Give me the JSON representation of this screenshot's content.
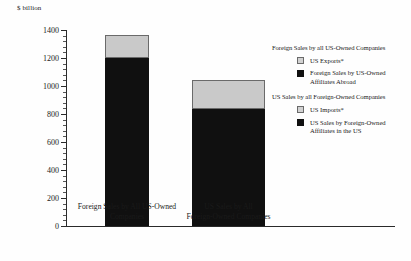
{
  "chart_data": {
    "type": "bar",
    "subtype": "stacked",
    "title": "",
    "xlabel": "",
    "ylabel": "$ billion",
    "ylim": [
      0,
      1400
    ],
    "ytick_step": 200,
    "yticks": [
      "0",
      "200",
      "400",
      "600",
      "800",
      "1000",
      "1200",
      "1400"
    ],
    "grid": false,
    "legend_position": "right",
    "categories": [
      "Foreign Sales by All US-Owned\nCompanies",
      "US Sales by All\nForeign-Owned Companies"
    ],
    "series": [
      {
        "name": "Sales by Affiliates",
        "color": "#101010",
        "values": [
          1200,
          835
        ]
      },
      {
        "name": "Trade (Exports / Imports)",
        "color": "#c9c9c9",
        "values": [
          165,
          210
        ]
      }
    ],
    "totals": [
      1365,
      1045
    ]
  },
  "axis": {
    "y_title": "$ billion"
  },
  "legend": {
    "groups": [
      {
        "heading": "Foreign Sales by all US-Owned Companies",
        "items": [
          {
            "label": "US Exports*",
            "swatch": "light"
          },
          {
            "label": "Foreign Sales by US-Owned\nAffiliates Abroad",
            "swatch": "dark"
          }
        ]
      },
      {
        "heading": "US Sales by all Foreign-Owned Companies",
        "items": [
          {
            "label": "US Imports*",
            "swatch": "light"
          },
          {
            "label": "US Sales by Foreign-Owned\nAffiliates in the US",
            "swatch": "dark"
          }
        ]
      }
    ]
  }
}
